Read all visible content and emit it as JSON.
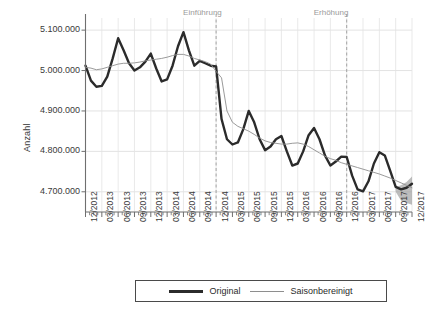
{
  "chart_data": {
    "type": "line",
    "title": "",
    "xlabel": "",
    "ylabel": "Anzahl",
    "ylim": [
      4650000,
      5130000
    ],
    "ytick_values": [
      5100000,
      5000000,
      4900000,
      4800000,
      4700000
    ],
    "ytick_labels": [
      "5.100.000",
      "5.000.000",
      "4.900.000",
      "4.800.000",
      "4.700.000"
    ],
    "grid": true,
    "legend_position": "bottom",
    "x": [
      "12/2012",
      "01/2013",
      "02/2013",
      "03/2013",
      "04/2013",
      "05/2013",
      "06/2013",
      "07/2013",
      "08/2013",
      "09/2013",
      "10/2013",
      "11/2013",
      "12/2013",
      "01/2014",
      "02/2014",
      "03/2014",
      "04/2014",
      "05/2014",
      "06/2014",
      "07/2014",
      "08/2014",
      "09/2014",
      "10/2014",
      "11/2014",
      "12/2014",
      "01/2015",
      "02/2015",
      "03/2015",
      "04/2015",
      "05/2015",
      "06/2015",
      "07/2015",
      "08/2015",
      "09/2015",
      "10/2015",
      "11/2015",
      "12/2015",
      "01/2016",
      "02/2016",
      "03/2016",
      "04/2016",
      "05/2016",
      "06/2016",
      "07/2016",
      "08/2016",
      "09/2016",
      "10/2016",
      "11/2016",
      "12/2016",
      "01/2017",
      "02/2017",
      "03/2017",
      "04/2017",
      "05/2017",
      "06/2017",
      "07/2017",
      "08/2017",
      "09/2017",
      "10/2017",
      "11/2017",
      "12/2017"
    ],
    "xtick_labels": [
      "12/2012",
      "03/2013",
      "06/2013",
      "09/2013",
      "12/2013",
      "03/2014",
      "06/2014",
      "09/2014",
      "12/2014",
      "03/2015",
      "06/2015",
      "09/2015",
      "12/2015",
      "03/2016",
      "06/2016",
      "09/2016",
      "12/2016",
      "03/2017",
      "06/2017",
      "09/2017",
      "12/2017"
    ],
    "minor_ticks_per_interval": 3,
    "series": [
      {
        "name": "Original",
        "color": "#2b2b2b",
        "width": 2.4,
        "values": [
          5012000,
          4975000,
          4960000,
          4962000,
          4985000,
          5030000,
          5080000,
          5050000,
          5018000,
          5000000,
          5008000,
          5022000,
          5042000,
          5005000,
          4973000,
          4978000,
          5012000,
          5060000,
          5095000,
          5050000,
          5012000,
          5024000,
          5018000,
          5012000,
          5010000,
          4880000,
          4830000,
          4817000,
          4822000,
          4855000,
          4900000,
          4872000,
          4830000,
          4803000,
          4812000,
          4830000,
          4838000,
          4800000,
          4765000,
          4770000,
          4800000,
          4840000,
          4858000,
          4830000,
          4790000,
          4765000,
          4775000,
          4787000,
          4786000,
          4740000,
          4706000,
          4701000,
          4726000,
          4770000,
          4798000,
          4790000,
          4752000,
          4712000,
          4706000,
          4710000,
          4720000
        ]
      },
      {
        "name": "Saisonbereinigt",
        "color": "#8e8e8e",
        "width": 0.9,
        "values": [
          5008000,
          5006000,
          5002000,
          5004000,
          5008000,
          5012000,
          5016000,
          5018000,
          5018000,
          5019000,
          5021000,
          5024000,
          5026000,
          5028000,
          5030000,
          5033000,
          5037000,
          5040000,
          5040000,
          5036000,
          5030000,
          5026000,
          5022000,
          5016000,
          4998000,
          4982000,
          4900000,
          4872000,
          4862000,
          4856000,
          4850000,
          4842000,
          4833000,
          4826000,
          4822000,
          4820000,
          4818000,
          4818000,
          4820000,
          4821000,
          4818000,
          4812000,
          4804000,
          4796000,
          4788000,
          4782000,
          4778000,
          4772000,
          4768000,
          4764000,
          4760000,
          4756000,
          4752000,
          4748000,
          4744000,
          4739000,
          4734000,
          4728000,
          4722000,
          4716000,
          4710000
        ]
      }
    ],
    "forecast_band": {
      "name": "prognose-band",
      "color": "#9a9a9a",
      "start_x": "09/2017",
      "lower": [
        4700000,
        4678000,
        4672000,
        4668000
      ],
      "upper": [
        4712000,
        4716000,
        4724000,
        4738000
      ]
    },
    "annotations": [
      {
        "label": "Einführung",
        "x": "12/2014",
        "line_style": "dashed",
        "color": "#9a9a9a"
      },
      {
        "label": "Erhöhung",
        "x": "12/2016",
        "line_style": "dashed",
        "color": "#9a9a9a"
      }
    ]
  },
  "legend": {
    "items": [
      {
        "label": "Original",
        "style": "thick-dark"
      },
      {
        "label": "Saisonbereinigt",
        "style": "thin-gray"
      }
    ]
  }
}
